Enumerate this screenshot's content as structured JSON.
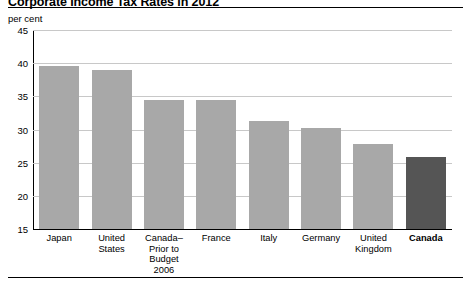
{
  "chart_data": {
    "type": "bar",
    "title": "Corporate Income Tax Rates in 2012",
    "subtitle": "",
    "unit_label": "per cent",
    "xlabel": "",
    "ylabel": "per cent",
    "ylim": [
      15,
      45
    ],
    "yticks": [
      15,
      20,
      25,
      30,
      35,
      40,
      45
    ],
    "ytick_labels": [
      "15",
      "20",
      "25",
      "30",
      "35",
      "40",
      "45"
    ],
    "grid": true,
    "legend": "none",
    "categories": [
      "Japan",
      "United States",
      "Canada–Prior to Budget 2006",
      "France",
      "Italy",
      "Germany",
      "United Kingdom",
      "Canada"
    ],
    "category_lines": [
      [
        "Japan"
      ],
      [
        "United",
        "States"
      ],
      [
        "Canada–",
        "Prior to",
        "Budget",
        "2006"
      ],
      [
        "France"
      ],
      [
        "Italy"
      ],
      [
        "Germany"
      ],
      [
        "United",
        "Kingdom"
      ],
      [
        "Canada"
      ]
    ],
    "values": [
      39.5,
      39.0,
      34.4,
      34.4,
      31.3,
      30.2,
      27.8,
      25.8
    ],
    "bar_colors": [
      "#a8a8a8",
      "#a8a8a8",
      "#a8a8a8",
      "#a8a8a8",
      "#a8a8a8",
      "#a8a8a8",
      "#a8a8a8",
      "#555555"
    ],
    "highlight_index": 7,
    "highlight_color": "#555555",
    "bar_color": "#a8a8a8",
    "grid_color": "#c8c8c8",
    "axis_color": "#000000"
  }
}
